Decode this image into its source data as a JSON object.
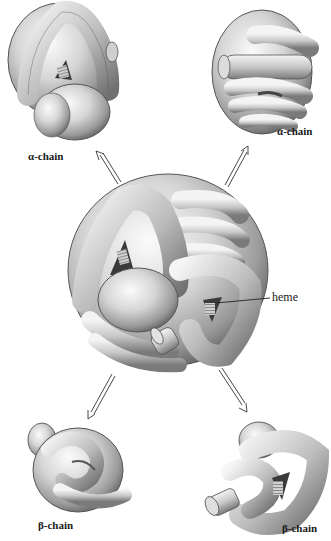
{
  "diagram": {
    "center": {
      "name": "hemoglobin-tetramer",
      "callout_label": "heme"
    },
    "subunits": [
      {
        "id": "top-left",
        "label": "α-chain"
      },
      {
        "id": "top-right",
        "label": "α-chain"
      },
      {
        "id": "bottom-left",
        "label": "β-chain"
      },
      {
        "id": "bottom-right",
        "label": "β-chain"
      }
    ],
    "arrows": [
      {
        "from": "center",
        "to": "top-left",
        "style": "double-line-open-head"
      },
      {
        "from": "center",
        "to": "top-right",
        "style": "double-line-open-head"
      },
      {
        "from": "center",
        "to": "bottom-left",
        "style": "double-line-open-head"
      },
      {
        "from": "center",
        "to": "bottom-right",
        "style": "double-line-open-head"
      }
    ],
    "colors": {
      "tube_light": "#f2f2f2",
      "tube_mid": "#bdbdbd",
      "tube_dark": "#6e6e6e",
      "outline": "#4a4a4a",
      "label_text": "#1a1a1a",
      "background": "#ffffff"
    }
  }
}
